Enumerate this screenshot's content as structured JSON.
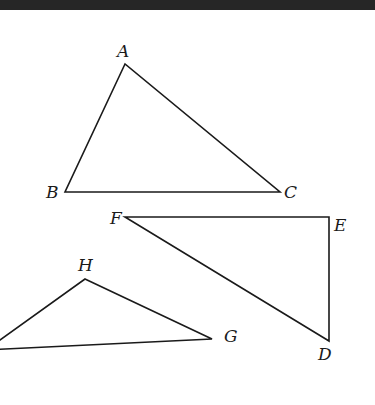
{
  "header_bar": {
    "color": "#262626"
  },
  "diagram": {
    "triangles": [
      {
        "name": "ABC",
        "vertices": [
          {
            "label": "A",
            "x": 125,
            "y": 64,
            "lx": 117,
            "ly": 57
          },
          {
            "label": "B",
            "x": 65,
            "y": 192,
            "lx": 46,
            "ly": 198
          },
          {
            "label": "C",
            "x": 280,
            "y": 192,
            "lx": 284,
            "ly": 198
          }
        ]
      },
      {
        "name": "FED",
        "vertices": [
          {
            "label": "F",
            "x": 125,
            "y": 217,
            "lx": 110,
            "ly": 224
          },
          {
            "label": "E",
            "x": 329,
            "y": 217,
            "lx": 334,
            "ly": 231
          },
          {
            "label": "D",
            "x": 329,
            "y": 341,
            "lx": 318,
            "ly": 360
          }
        ]
      },
      {
        "name": "HG",
        "vertices": [
          {
            "label": "H",
            "x": 85,
            "y": 279,
            "lx": 78,
            "ly": 271
          },
          {
            "label": "G",
            "x": 212,
            "y": 339,
            "lx": 224,
            "ly": 342
          },
          {
            "label": "",
            "x": -14,
            "y": 350,
            "lx": 0,
            "ly": 0
          }
        ]
      }
    ]
  }
}
